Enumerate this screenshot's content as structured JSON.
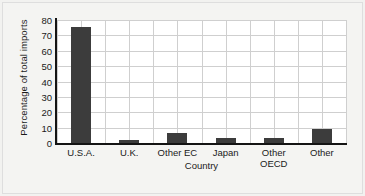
{
  "chart_data": {
    "type": "bar",
    "title": "",
    "subtitle": "",
    "xlabel": "Country",
    "ylabel": "Percentage of total imports",
    "categories": [
      "U.S.A.",
      "U.K.",
      "Other EC",
      "Japan",
      "Other\nOECD",
      "Other"
    ],
    "values": [
      75.5,
      2,
      6.5,
      3.5,
      3,
      9
    ],
    "ylim": [
      0,
      80
    ],
    "ytick_labels": [
      "0",
      "10",
      "20",
      "30",
      "40",
      "50",
      "60",
      "70",
      "80"
    ],
    "ytick_values": [
      0,
      10,
      20,
      30,
      40,
      50,
      60,
      70,
      80
    ],
    "grid": "both",
    "legend": "none",
    "bar_color": "#3c3c3c",
    "grid_color": "#cfcfcf",
    "axis_color": "#141414",
    "plot_background": "#ffffff",
    "figure_background": "#f2f2f0"
  }
}
